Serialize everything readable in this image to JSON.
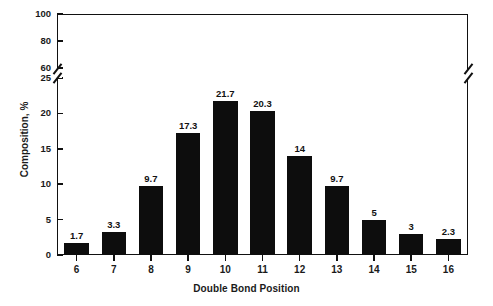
{
  "chart_data": {
    "type": "bar",
    "title": "",
    "xlabel": "Double Bond Position",
    "ylabel": "Composition, %",
    "categories": [
      "6",
      "7",
      "8",
      "9",
      "10",
      "11",
      "12",
      "13",
      "14",
      "15",
      "16"
    ],
    "values": [
      1.7,
      3.3,
      9.7,
      17.3,
      21.7,
      20.3,
      14,
      9.7,
      5,
      3,
      2.3
    ],
    "value_labels": [
      "1.7",
      "3.3",
      "9.7",
      "17.3",
      "21.7",
      "20.3",
      "14",
      "9.7",
      "5",
      "3",
      "2.3"
    ],
    "ylim": [
      0,
      100
    ],
    "y_axis_broken": true,
    "y_break_range": [
      25,
      60
    ],
    "y_ticks_lower": [
      "0",
      "5",
      "10",
      "15",
      "20",
      "25"
    ],
    "y_ticks_upper": [
      "60",
      "80",
      "100"
    ],
    "y_tick_labels": [
      "0",
      "5",
      "10",
      "15",
      "20",
      "25",
      "60",
      "80",
      "100"
    ],
    "grid": false,
    "legend": "none",
    "bar_color": "#0d0d0d",
    "axis_color": "#111111",
    "background_color": "#ffffff"
  },
  "axis": {
    "y_title": "Composition, %",
    "x_title": "Double Bond Position"
  }
}
